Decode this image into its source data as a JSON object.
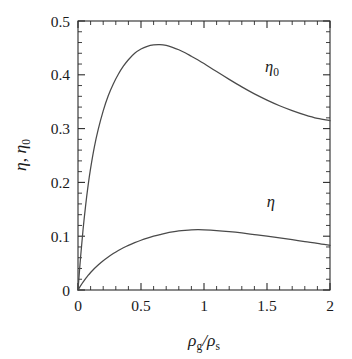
{
  "figure": {
    "background": "#ffffff",
    "ink": "#2b2b2b",
    "curve_color": "#4a4a4a"
  },
  "chart_data": {
    "type": "line",
    "title": "",
    "subtitle": "",
    "xlabel": "ρ_g/ρ_s",
    "xlabel_parts": {
      "rho1": "ρ",
      "sub1": "g",
      "slash": "/",
      "rho2": "ρ",
      "sub2": "s"
    },
    "ylabel": "η, η₀",
    "ylabel_parts": {
      "eta": "η",
      "comma": ",",
      "eta0": "η",
      "sub0": "0"
    },
    "xlim": [
      0,
      2
    ],
    "ylim": [
      0,
      0.5
    ],
    "grid": false,
    "legend_position": "inline-annotations",
    "xticks": [
      0,
      0.5,
      1,
      1.5,
      2
    ],
    "xtick_labels": [
      "0",
      "0.5",
      "1",
      "1.5",
      "2"
    ],
    "x_minor_step": 0.1,
    "yticks": [
      0,
      0.1,
      0.2,
      0.3,
      0.4,
      0.5
    ],
    "ytick_labels": [
      "0",
      "0.1",
      "0.2",
      "0.3",
      "0.4",
      "0.5"
    ],
    "y_minor_step": 0.02,
    "annotations": [
      {
        "text": "η₀",
        "base": "η",
        "sub": "0",
        "x": 1.54,
        "y": 0.405,
        "name": "eta-zero-curve-label"
      },
      {
        "text": "η",
        "base": "η",
        "sub": "",
        "x": 1.53,
        "y": 0.155,
        "name": "eta-curve-label"
      }
    ],
    "series": [
      {
        "name": "η₀",
        "label_base": "η",
        "label_sub": "0",
        "x": [
          0,
          0.02,
          0.04,
          0.06,
          0.08,
          0.1,
          0.13,
          0.16,
          0.2,
          0.24,
          0.28,
          0.32,
          0.36,
          0.4,
          0.45,
          0.5,
          0.55,
          0.6,
          0.65,
          0.7,
          0.75,
          0.8,
          0.85,
          0.9,
          0.95,
          1.0,
          1.1,
          1.2,
          1.3,
          1.4,
          1.5,
          1.6,
          1.7,
          1.8,
          1.9,
          2.0
        ],
        "y": [
          0.0,
          0.06,
          0.112,
          0.156,
          0.194,
          0.226,
          0.266,
          0.298,
          0.333,
          0.361,
          0.383,
          0.401,
          0.416,
          0.428,
          0.44,
          0.448,
          0.453,
          0.4555,
          0.456,
          0.4545,
          0.451,
          0.4465,
          0.441,
          0.4345,
          0.428,
          0.421,
          0.406,
          0.3915,
          0.3775,
          0.3645,
          0.353,
          0.3425,
          0.3335,
          0.3255,
          0.319,
          0.315
        ],
        "peak": {
          "x": 0.65,
          "y": 0.456
        },
        "end": {
          "x": 2.0,
          "y": 0.315
        }
      },
      {
        "name": "η",
        "label_base": "η",
        "label_sub": "",
        "x": [
          0,
          0.02,
          0.04,
          0.06,
          0.08,
          0.1,
          0.13,
          0.16,
          0.2,
          0.24,
          0.28,
          0.32,
          0.36,
          0.4,
          0.45,
          0.5,
          0.55,
          0.6,
          0.65,
          0.7,
          0.75,
          0.8,
          0.85,
          0.9,
          0.95,
          1.0,
          1.1,
          1.2,
          1.3,
          1.4,
          1.5,
          1.6,
          1.7,
          1.8,
          1.9,
          2.0
        ],
        "y": [
          0.0,
          0.0075,
          0.0145,
          0.021,
          0.027,
          0.0325,
          0.04,
          0.0465,
          0.0545,
          0.0615,
          0.0678,
          0.0735,
          0.0785,
          0.083,
          0.088,
          0.0925,
          0.0965,
          0.1,
          0.103,
          0.1058,
          0.108,
          0.1098,
          0.111,
          0.1118,
          0.112,
          0.1118,
          0.1105,
          0.1085,
          0.106,
          0.103,
          0.1,
          0.0968,
          0.0935,
          0.09,
          0.0868,
          0.083
        ],
        "peak": {
          "x": 0.93,
          "y": 0.112
        },
        "end": {
          "x": 2.0,
          "y": 0.083
        }
      }
    ]
  }
}
